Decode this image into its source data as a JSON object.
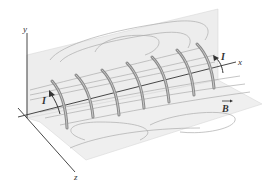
{
  "figure": {
    "axes": {
      "x_label": "x",
      "y_label": "y",
      "z_label": "z"
    },
    "labels": {
      "current_left": "I",
      "current_right": "I",
      "field": "B"
    },
    "coil_count": 7,
    "colors": {
      "plane_fill": "#ececec",
      "plane_edge": "#d6d6d6",
      "field_line": "#a9a9a9",
      "coil": "#8a8a8a",
      "coil_highlight": "#c8c8c8",
      "axis": "#333333",
      "arrow": "#333333"
    }
  }
}
